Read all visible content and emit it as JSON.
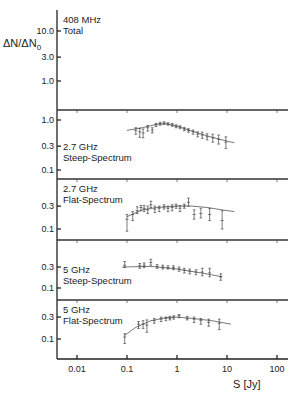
{
  "chart_data": {
    "type": "scatter",
    "ylabel": "ΔN/ΔN0",
    "xlabel": "S [Jy]",
    "xscale": "log",
    "xlim": [
      0.0035,
      200
    ],
    "xticks": [
      "0.01",
      "0.1",
      "1",
      "10",
      "100"
    ],
    "xtick_values": [
      0.01,
      0.1,
      1,
      10,
      100
    ],
    "panels": [
      {
        "label_line1": "408 MHz",
        "label_line2": "Total",
        "yscale": "log",
        "yticks": [
          "10.0",
          "3.0",
          "1.0"
        ],
        "ytick_values": [
          10.0,
          3.0,
          1.0
        ],
        "points": [],
        "fit": []
      },
      {
        "label_line1": "2.7 GHz",
        "label_line2": "Steep-Spectrum",
        "yscale": "log",
        "yticks": [
          "1.0",
          "0.3",
          "0.1"
        ],
        "ytick_values": [
          1.0,
          0.3,
          0.1
        ],
        "points": [
          {
            "x": 0.15,
            "y": 0.62,
            "lo": 0.52,
            "hi": 0.7
          },
          {
            "x": 0.18,
            "y": 0.58,
            "lo": 0.45,
            "hi": 0.68
          },
          {
            "x": 0.21,
            "y": 0.55,
            "lo": 0.44,
            "hi": 0.66
          },
          {
            "x": 0.26,
            "y": 0.7,
            "lo": 0.6,
            "hi": 0.78
          },
          {
            "x": 0.32,
            "y": 0.63,
            "lo": 0.55,
            "hi": 0.7
          },
          {
            "x": 0.38,
            "y": 0.8,
            "lo": 0.74,
            "hi": 0.86
          },
          {
            "x": 0.46,
            "y": 0.85,
            "lo": 0.79,
            "hi": 0.9
          },
          {
            "x": 0.55,
            "y": 0.87,
            "lo": 0.82,
            "hi": 0.92
          },
          {
            "x": 0.66,
            "y": 0.84,
            "lo": 0.79,
            "hi": 0.88
          },
          {
            "x": 0.8,
            "y": 0.8,
            "lo": 0.75,
            "hi": 0.85
          },
          {
            "x": 0.96,
            "y": 0.75,
            "lo": 0.7,
            "hi": 0.8
          },
          {
            "x": 1.15,
            "y": 0.72,
            "lo": 0.67,
            "hi": 0.77
          },
          {
            "x": 1.4,
            "y": 0.66,
            "lo": 0.61,
            "hi": 0.71
          },
          {
            "x": 1.7,
            "y": 0.62,
            "lo": 0.57,
            "hi": 0.67
          },
          {
            "x": 2.1,
            "y": 0.58,
            "lo": 0.52,
            "hi": 0.63
          },
          {
            "x": 2.6,
            "y": 0.52,
            "lo": 0.46,
            "hi": 0.58
          },
          {
            "x": 3.2,
            "y": 0.5,
            "lo": 0.43,
            "hi": 0.57
          },
          {
            "x": 4.0,
            "y": 0.46,
            "lo": 0.4,
            "hi": 0.53
          },
          {
            "x": 5.2,
            "y": 0.44,
            "lo": 0.36,
            "hi": 0.52
          },
          {
            "x": 6.8,
            "y": 0.41,
            "lo": 0.33,
            "hi": 0.5
          },
          {
            "x": 9.5,
            "y": 0.36,
            "lo": 0.27,
            "hi": 0.46
          }
        ],
        "fit": [
          [
            0.1,
            0.62
          ],
          [
            0.2,
            0.7
          ],
          [
            0.4,
            0.82
          ],
          [
            0.6,
            0.84
          ],
          [
            1.0,
            0.75
          ],
          [
            2.0,
            0.6
          ],
          [
            4.0,
            0.48
          ],
          [
            8.0,
            0.4
          ],
          [
            14.0,
            0.35
          ]
        ]
      },
      {
        "label_line1": "2.7 GHz",
        "label_line2": "Flat-Spectrum",
        "yscale": "log",
        "yticks": [
          "0.3",
          "0.1"
        ],
        "ytick_values": [
          0.3,
          0.1
        ],
        "points": [
          {
            "x": 0.1,
            "y": 0.16,
            "lo": 0.09,
            "hi": 0.2
          },
          {
            "x": 0.13,
            "y": 0.2,
            "lo": 0.15,
            "hi": 0.23
          },
          {
            "x": 0.16,
            "y": 0.24,
            "lo": 0.21,
            "hi": 0.29
          },
          {
            "x": 0.19,
            "y": 0.28,
            "lo": 0.24,
            "hi": 0.31
          },
          {
            "x": 0.22,
            "y": 0.27,
            "lo": 0.23,
            "hi": 0.31
          },
          {
            "x": 0.26,
            "y": 0.25,
            "lo": 0.21,
            "hi": 0.3
          },
          {
            "x": 0.3,
            "y": 0.32,
            "lo": 0.28,
            "hi": 0.38
          },
          {
            "x": 0.36,
            "y": 0.26,
            "lo": 0.22,
            "hi": 0.3
          },
          {
            "x": 0.44,
            "y": 0.27,
            "lo": 0.23,
            "hi": 0.3
          },
          {
            "x": 0.55,
            "y": 0.29,
            "lo": 0.26,
            "hi": 0.32
          },
          {
            "x": 0.66,
            "y": 0.27,
            "lo": 0.23,
            "hi": 0.3
          },
          {
            "x": 0.8,
            "y": 0.28,
            "lo": 0.24,
            "hi": 0.32
          },
          {
            "x": 0.96,
            "y": 0.3,
            "lo": 0.27,
            "hi": 0.33
          },
          {
            "x": 1.15,
            "y": 0.27,
            "lo": 0.23,
            "hi": 0.31
          },
          {
            "x": 1.4,
            "y": 0.3,
            "lo": 0.27,
            "hi": 0.33
          },
          {
            "x": 1.7,
            "y": 0.36,
            "lo": 0.3,
            "hi": 0.44
          },
          {
            "x": 2.2,
            "y": 0.2,
            "lo": 0.16,
            "hi": 0.25
          },
          {
            "x": 3.0,
            "y": 0.21,
            "lo": 0.17,
            "hi": 0.27
          },
          {
            "x": 4.5,
            "y": 0.2,
            "lo": 0.15,
            "hi": 0.27
          },
          {
            "x": 8.0,
            "y": 0.15,
            "lo": 0.1,
            "hi": 0.24
          }
        ],
        "fit": [
          [
            0.1,
            0.18
          ],
          [
            0.2,
            0.25
          ],
          [
            0.4,
            0.28
          ],
          [
            1.0,
            0.3
          ],
          [
            2.0,
            0.3
          ],
          [
            4.0,
            0.28
          ],
          [
            8.0,
            0.25
          ],
          [
            14.0,
            0.23
          ]
        ]
      },
      {
        "label_line1": "5 GHz",
        "label_line2": "Steep-Spectrum",
        "yscale": "log",
        "yticks": [
          "0.3",
          "0.1"
        ],
        "ytick_values": [
          0.3,
          0.1
        ],
        "points": [
          {
            "x": 0.09,
            "y": 0.33,
            "lo": 0.29,
            "hi": 0.4
          },
          {
            "x": 0.18,
            "y": 0.32,
            "lo": 0.28,
            "hi": 0.36
          },
          {
            "x": 0.22,
            "y": 0.33,
            "lo": 0.29,
            "hi": 0.37
          },
          {
            "x": 0.3,
            "y": 0.38,
            "lo": 0.33,
            "hi": 0.45
          },
          {
            "x": 0.4,
            "y": 0.31,
            "lo": 0.28,
            "hi": 0.34
          },
          {
            "x": 0.52,
            "y": 0.3,
            "lo": 0.27,
            "hi": 0.33
          },
          {
            "x": 0.66,
            "y": 0.29,
            "lo": 0.27,
            "hi": 0.32
          },
          {
            "x": 0.85,
            "y": 0.29,
            "lo": 0.26,
            "hi": 0.32
          },
          {
            "x": 1.1,
            "y": 0.27,
            "lo": 0.24,
            "hi": 0.3
          },
          {
            "x": 1.4,
            "y": 0.25,
            "lo": 0.22,
            "hi": 0.28
          },
          {
            "x": 1.8,
            "y": 0.24,
            "lo": 0.21,
            "hi": 0.27
          },
          {
            "x": 2.4,
            "y": 0.23,
            "lo": 0.2,
            "hi": 0.26
          },
          {
            "x": 3.2,
            "y": 0.23,
            "lo": 0.19,
            "hi": 0.28
          },
          {
            "x": 4.5,
            "y": 0.22,
            "lo": 0.18,
            "hi": 0.28
          },
          {
            "x": 7.5,
            "y": 0.18,
            "lo": 0.15,
            "hi": 0.21
          }
        ],
        "fit": [
          [
            0.08,
            0.3
          ],
          [
            0.3,
            0.31
          ],
          [
            1.0,
            0.27
          ],
          [
            3.0,
            0.22
          ],
          [
            8.0,
            0.18
          ]
        ]
      },
      {
        "label_line1": "5 GHz",
        "label_line2": "Flat-Spectrum",
        "yscale": "log",
        "yticks": [
          "0.3",
          "0.1"
        ],
        "ytick_values": [
          0.3,
          0.1
        ],
        "points": [
          {
            "x": 0.09,
            "y": 0.11,
            "lo": 0.08,
            "hi": 0.13
          },
          {
            "x": 0.17,
            "y": 0.21,
            "lo": 0.17,
            "hi": 0.24
          },
          {
            "x": 0.21,
            "y": 0.21,
            "lo": 0.17,
            "hi": 0.25
          },
          {
            "x": 0.25,
            "y": 0.2,
            "lo": 0.14,
            "hi": 0.26
          },
          {
            "x": 0.35,
            "y": 0.25,
            "lo": 0.22,
            "hi": 0.28
          },
          {
            "x": 0.48,
            "y": 0.27,
            "lo": 0.24,
            "hi": 0.3
          },
          {
            "x": 0.6,
            "y": 0.28,
            "lo": 0.25,
            "hi": 0.3
          },
          {
            "x": 0.72,
            "y": 0.28,
            "lo": 0.26,
            "hi": 0.31
          },
          {
            "x": 0.86,
            "y": 0.3,
            "lo": 0.27,
            "hi": 0.32
          },
          {
            "x": 1.1,
            "y": 0.32,
            "lo": 0.29,
            "hi": 0.34
          },
          {
            "x": 1.6,
            "y": 0.28,
            "lo": 0.26,
            "hi": 0.31
          },
          {
            "x": 2.2,
            "y": 0.27,
            "lo": 0.23,
            "hi": 0.3
          },
          {
            "x": 3.0,
            "y": 0.25,
            "lo": 0.21,
            "hi": 0.28
          },
          {
            "x": 4.3,
            "y": 0.23,
            "lo": 0.19,
            "hi": 0.27
          },
          {
            "x": 7.0,
            "y": 0.22,
            "lo": 0.16,
            "hi": 0.27
          }
        ],
        "fit": [
          [
            0.09,
            0.12
          ],
          [
            0.15,
            0.18
          ],
          [
            0.3,
            0.25
          ],
          [
            0.6,
            0.29
          ],
          [
            1.0,
            0.3
          ],
          [
            2.0,
            0.28
          ],
          [
            5.0,
            0.25
          ],
          [
            12.0,
            0.21
          ]
        ]
      }
    ],
    "grid": false,
    "legend": "none (panel labels inline)"
  }
}
